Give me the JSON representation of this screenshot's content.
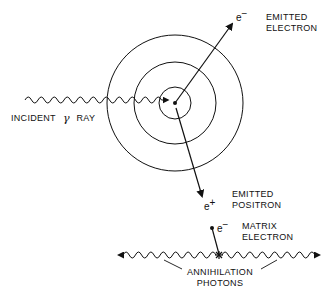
{
  "diagram": {
    "type": "pair-production-annihilation",
    "nucleus": {
      "cx": 175,
      "cy": 103
    },
    "shells": [
      {
        "r": 16
      },
      {
        "r": 41
      },
      {
        "r": 68
      }
    ],
    "incident_ray": {
      "label_prefix": "INCIDENT",
      "label_symbol": "γ",
      "label_suffix": "RAY"
    },
    "emitted_electron": {
      "symbol": "e",
      "charge": "−",
      "label_line1": "EMITTED",
      "label_line2": "ELECTRON"
    },
    "emitted_positron": {
      "symbol": "e",
      "charge": "+",
      "label_line1": "EMITTED",
      "label_line2": "POSITRON"
    },
    "matrix_electron": {
      "symbol": "e",
      "charge": "−",
      "label_line1": "MATRIX",
      "label_line2": "ELECTRON"
    },
    "annihilation": {
      "label_line1": "ANNIHILATION",
      "label_line2": "PHOTONS"
    }
  },
  "colors": {
    "ink": "#111111",
    "background": "#ffffff"
  }
}
